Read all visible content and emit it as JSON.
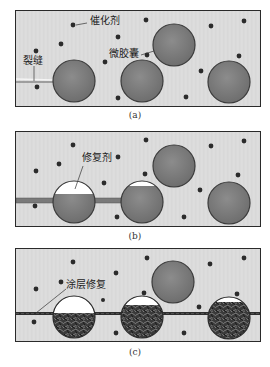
{
  "figure": {
    "panels": [
      {
        "id": "a",
        "caption": "(a)",
        "labels": {
          "catalyst": "催化剂",
          "microcapsule": "微胶囊",
          "crack": "裂缝"
        }
      },
      {
        "id": "b",
        "caption": "(b)",
        "labels": {
          "healing_agent": "修复剂"
        }
      },
      {
        "id": "c",
        "caption": "(c)",
        "labels": {
          "coating_repair": "涂层修复"
        }
      }
    ],
    "colors": {
      "matrix": "#dcdcdc",
      "microcapsule": "#7d7d7d",
      "microcapsule_edge": "#3a3a3a",
      "catalyst_dot": "#2b2b2b",
      "crack": "#8a8a8a",
      "polymerized": "#2e2e2e",
      "border": "#2a2a2a"
    }
  }
}
